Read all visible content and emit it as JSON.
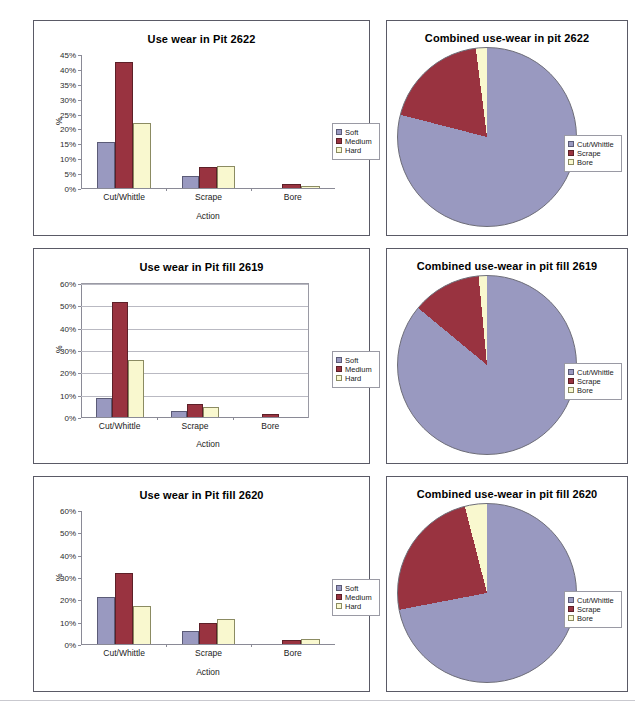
{
  "page": {
    "series_names": [
      "Soft",
      "Medium",
      "Hard"
    ],
    "pie_series_names": [
      "Cut/Whittle",
      "Scrape",
      "Bore"
    ],
    "colors": {
      "soft": "#9999c0",
      "medium": "#993340",
      "hard": "#f9f8cf",
      "cut_whittle": "#9999c0",
      "scrape": "#993340",
      "bore": "#f9f8cf",
      "panel_border": "#5a5a66",
      "axis": "#8a8a96",
      "grid": "#b9b9c2"
    }
  },
  "chart_data": [
    {
      "id": "bar-2622",
      "type": "bar",
      "title": "Use wear in Pit 2622",
      "xlabel": "Action",
      "ylabel": "%",
      "categories": [
        "Cut/Whittle",
        "Scrape",
        "Bore"
      ],
      "series": [
        {
          "name": "Soft",
          "values": [
            15.3,
            4.1,
            0.0
          ]
        },
        {
          "name": "Medium",
          "values": [
            42.3,
            7.2,
            1.5
          ]
        },
        {
          "name": "Hard",
          "values": [
            21.8,
            7.3,
            0.7
          ]
        }
      ],
      "ylim": [
        0,
        45
      ],
      "ytick_step": 5,
      "yticks": [
        "0%",
        "5%",
        "10%",
        "15%",
        "20%",
        "25%",
        "30%",
        "35%",
        "40%",
        "45%"
      ],
      "grid": false,
      "plot_frame": false,
      "legend_position": "right"
    },
    {
      "id": "bar-2619",
      "type": "bar",
      "title": "Use wear in Pit fill 2619",
      "xlabel": "Action",
      "ylabel": "%",
      "categories": [
        "Cut/Whittle",
        "Scrape",
        "Bore"
      ],
      "series": [
        {
          "name": "Soft",
          "values": [
            8.6,
            2.7,
            0.0
          ]
        },
        {
          "name": "Medium",
          "values": [
            51.3,
            5.7,
            1.4
          ]
        },
        {
          "name": "Hard",
          "values": [
            25.4,
            4.4,
            0.0
          ]
        }
      ],
      "ylim": [
        0,
        60
      ],
      "ytick_step": 10,
      "yticks": [
        "0%",
        "10%",
        "20%",
        "30%",
        "40%",
        "50%",
        "60%"
      ],
      "grid": true,
      "plot_frame": true,
      "legend_position": "right"
    },
    {
      "id": "bar-2620",
      "type": "bar",
      "title": "Use wear in Pit fill 2620",
      "xlabel": "Action",
      "ylabel": "%",
      "categories": [
        "Cut/Whittle",
        "Scrape",
        "Bore"
      ],
      "series": [
        {
          "name": "Soft",
          "values": [
            20.9,
            5.9,
            0.0
          ]
        },
        {
          "name": "Medium",
          "values": [
            31.9,
            9.6,
            2.0
          ]
        },
        {
          "name": "Hard",
          "values": [
            17.1,
            11.3,
            2.1
          ]
        }
      ],
      "ylim": [
        0,
        60
      ],
      "ytick_step": 10,
      "yticks": [
        "0%",
        "10%",
        "20%",
        "30%",
        "40%",
        "50%",
        "60%"
      ],
      "grid": false,
      "plot_frame": false,
      "legend_position": "right"
    },
    {
      "id": "pie-2622",
      "type": "pie",
      "title": "Combined use-wear in pit 2622",
      "labels": [
        "Cut/Whittle",
        "Scrape",
        "Bore"
      ],
      "values": [
        79.0,
        19.0,
        2.0
      ],
      "colors": [
        "#9999c0",
        "#993340",
        "#f9f8cf"
      ],
      "start_angle_deg": 0,
      "legend_position": "right"
    },
    {
      "id": "pie-2619",
      "type": "pie",
      "title": "Combined use-wear in pit fill 2619",
      "labels": [
        "Cut/Whittle",
        "Scrape",
        "Bore"
      ],
      "values": [
        86.0,
        12.5,
        1.5
      ],
      "colors": [
        "#9999c0",
        "#993340",
        "#f9f8cf"
      ],
      "start_angle_deg": 0,
      "legend_position": "right"
    },
    {
      "id": "pie-2620",
      "type": "pie",
      "title": "Combined use-wear in pit fill 2620",
      "labels": [
        "Cut/Whittle",
        "Scrape",
        "Bore"
      ],
      "values": [
        72.0,
        24.0,
        4.0
      ],
      "colors": [
        "#9999c0",
        "#993340",
        "#f9f8cf"
      ],
      "start_angle_deg": 0,
      "legend_position": "right"
    }
  ]
}
